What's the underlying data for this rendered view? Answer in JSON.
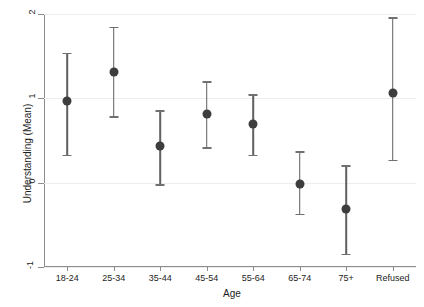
{
  "chart_data": {
    "type": "scatter",
    "title": "",
    "xlabel": "Age",
    "ylabel": "Understanding (Mean)",
    "categories": [
      "18-24",
      "25-34",
      "35-44",
      "45-54",
      "55-64",
      "65-74",
      "75+",
      "Refused"
    ],
    "values": [
      0.97,
      1.31,
      0.43,
      0.82,
      0.69,
      -0.01,
      -0.31,
      1.06
    ],
    "error_upper": [
      1.54,
      1.85,
      0.86,
      1.2,
      1.05,
      0.37,
      0.21,
      1.96
    ],
    "error_lower": [
      0.33,
      0.79,
      -0.02,
      0.42,
      0.33,
      -0.37,
      -0.84,
      0.27
    ],
    "ylim": [
      -1,
      2
    ],
    "yticks": [
      2,
      1,
      0,
      -1
    ],
    "ytick_labels": [
      "2",
      "1",
      "0",
      "-1"
    ],
    "xlim_categories": 8,
    "grid": "horizontal",
    "legend": "none",
    "marker": "filled-circle",
    "marker_color": "#3d3d3d",
    "errorbar_color": "#606060",
    "gridline_color": "#ededed",
    "axis_color": "#8c8c8c",
    "background": "#ffffff"
  },
  "axes": {
    "y_title": "Understanding (Mean)",
    "x_title": "Age"
  },
  "points": [
    {
      "category": "18-24",
      "mean": "0.97",
      "upper": "1.54",
      "lower": "0.33"
    },
    {
      "category": "25-34",
      "mean": "1.31",
      "upper": "1.85",
      "lower": "0.79"
    },
    {
      "category": "35-44",
      "mean": "0.43",
      "upper": "0.86",
      "lower": "-0.02"
    },
    {
      "category": "45-54",
      "mean": "0.82",
      "upper": "1.20",
      "lower": "0.42"
    },
    {
      "category": "55-64",
      "mean": "0.69",
      "upper": "1.05",
      "lower": "0.33"
    },
    {
      "category": "65-74",
      "mean": "-0.01",
      "upper": "0.37",
      "lower": "-0.37"
    },
    {
      "category": "75+",
      "mean": "-0.31",
      "upper": "0.21",
      "lower": "-0.84"
    },
    {
      "category": "Refused",
      "mean": "1.06",
      "upper": "1.96",
      "lower": "0.27"
    }
  ],
  "y_ticks": [
    {
      "label": "2"
    },
    {
      "label": "1"
    },
    {
      "label": "0"
    },
    {
      "label": "-1"
    }
  ]
}
